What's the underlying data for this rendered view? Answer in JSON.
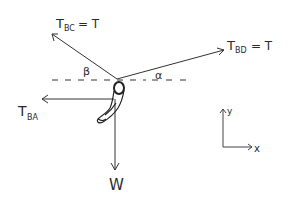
{
  "diagram": {
    "forces": {
      "t_bc": {
        "main": "T",
        "sub": "BC",
        "eq": "= T"
      },
      "t_bd": {
        "main": "T",
        "sub": "BD",
        "eq": "= T"
      },
      "t_ba": {
        "main": "T",
        "sub": "BA"
      },
      "w": {
        "main": "W"
      }
    },
    "angles": {
      "beta": "β",
      "alpha": "α"
    },
    "axes": {
      "y": "y",
      "x": "x"
    },
    "colors": {
      "ink": "#2a2a2a",
      "background": "#ffffff"
    }
  }
}
